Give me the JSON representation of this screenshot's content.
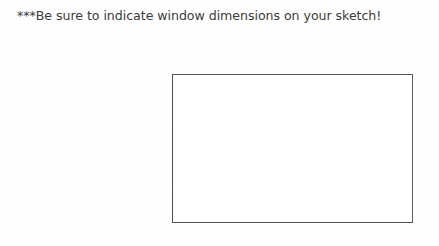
{
  "page": {
    "background_color": "#fefefe",
    "width": 439,
    "height": 246
  },
  "instruction": {
    "text": "***Be sure to indicate window dimensions on your sketch!",
    "color": "#3b3b3b",
    "emphasis_marker": "***"
  },
  "sketch_area": {
    "label": "",
    "placeholder": "",
    "content": "",
    "border_color": "#565656",
    "fill_color": "#ffffff",
    "x": 172,
    "y": 74,
    "width": 241,
    "height": 149
  }
}
